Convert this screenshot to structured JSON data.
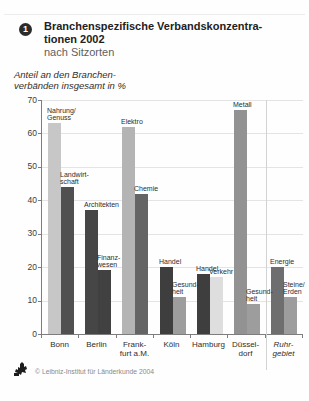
{
  "figure": {
    "badge": "1",
    "title_line1": "Branchenspezifische Verbandskonzentra-",
    "title_line2": "tionen 2002",
    "title_line3": "nach Sitzorten",
    "unit_note_line1": "Anteil an den Branchen-",
    "unit_note_line2": "verbänden insgesamt in %",
    "credit": "© Leibniz-Institut für Länderkunde 2004",
    "logo_icon": "institute-stamp-logo"
  },
  "chart_data": {
    "type": "bar",
    "ylabel": "Anteil an den Branchenverbänden insgesamt in %",
    "xlabel": "",
    "ylim": [
      0,
      70
    ],
    "yticks": [
      0,
      10,
      20,
      30,
      40,
      50,
      60,
      70
    ],
    "grid": true,
    "legend_position": "none (bars labeled directly)",
    "axis_color": "#7d7d7d",
    "gridline_color": "#e4e4e4",
    "categories": [
      "Bonn",
      "Berlin",
      "Frank-|furt a.M.",
      "Köln",
      "Hamburg",
      "Düssel-|dorf",
      "Ruhr-|gebiet"
    ],
    "groups": [
      {
        "category": "Bonn",
        "italic": false,
        "separator_before": false,
        "bars": [
          {
            "label": "Nahrung/|Genuss",
            "value": 63,
            "color": "#c7c7c7"
          },
          {
            "label": "Landwirt-|schaft",
            "value": 44,
            "color": "#505050"
          }
        ]
      },
      {
        "category": "Berlin",
        "italic": false,
        "separator_before": false,
        "bars": [
          {
            "label": "Architekten",
            "value": 37,
            "color": "#464646"
          },
          {
            "label": "Finanz-|wesen",
            "value": 19,
            "color": "#414141"
          }
        ]
      },
      {
        "category": "Frank-|furt a.M.",
        "italic": false,
        "separator_before": false,
        "bars": [
          {
            "label": "Elektro",
            "value": 62,
            "color": "#b4b4b4"
          },
          {
            "label": "Chemie",
            "value": 42,
            "color": "#646464"
          }
        ]
      },
      {
        "category": "Köln",
        "italic": false,
        "separator_before": false,
        "bars": [
          {
            "label": "Handel",
            "value": 20,
            "color": "#3e3e3e"
          },
          {
            "label": "Gesund-|heit",
            "value": 11,
            "color": "#9d9d9d"
          }
        ]
      },
      {
        "category": "Hamburg",
        "italic": false,
        "separator_before": false,
        "bars": [
          {
            "label": "Handel",
            "value": 18,
            "color": "#3e3e3e"
          },
          {
            "label": "Verkehr",
            "value": 17,
            "color": "#dedede"
          }
        ]
      },
      {
        "category": "Düssel-|dorf",
        "italic": false,
        "separator_before": false,
        "bars": [
          {
            "label": "Metall",
            "value": 67,
            "color": "#929292"
          },
          {
            "label": "Gesund-|heit",
            "value": 9,
            "color": "#9d9d9d"
          }
        ]
      },
      {
        "category": "Ruhr-|gebiet",
        "italic": true,
        "separator_before": true,
        "bars": [
          {
            "label": "Energie",
            "value": 20,
            "color": "#6e6e6e"
          },
          {
            "label": "Steine/|Erden",
            "value": 11,
            "color": "#9d9d9d"
          }
        ]
      }
    ]
  }
}
